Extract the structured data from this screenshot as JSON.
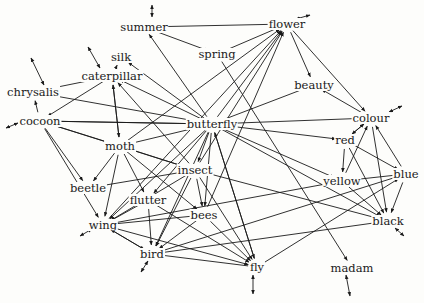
{
  "nodes": [
    {
      "id": "summer",
      "label": "summer",
      "x": 144,
      "y": 27
    },
    {
      "id": "flower",
      "label": "flower",
      "x": 287,
      "y": 24
    },
    {
      "id": "spring",
      "label": "spring",
      "x": 217,
      "y": 54
    },
    {
      "id": "silk",
      "label": "silk",
      "x": 121,
      "y": 57
    },
    {
      "id": "caterpillar",
      "label": "caterpillar",
      "x": 112,
      "y": 76
    },
    {
      "id": "beauty",
      "label": "beauty",
      "x": 314,
      "y": 85
    },
    {
      "id": "chrysalis",
      "label": "chrysalis",
      "x": 33,
      "y": 92
    },
    {
      "id": "cocoon",
      "label": "cocoon",
      "x": 40,
      "y": 121
    },
    {
      "id": "butterfly",
      "label": "butterfly",
      "x": 212,
      "y": 124
    },
    {
      "id": "colour",
      "label": "colour",
      "x": 371,
      "y": 118
    },
    {
      "id": "moth",
      "label": "moth",
      "x": 120,
      "y": 146
    },
    {
      "id": "red",
      "label": "red",
      "x": 345,
      "y": 140
    },
    {
      "id": "insect",
      "label": "insect",
      "x": 195,
      "y": 170
    },
    {
      "id": "yellow",
      "label": "yellow",
      "x": 342,
      "y": 181
    },
    {
      "id": "blue",
      "label": "blue",
      "x": 406,
      "y": 174
    },
    {
      "id": "beetle",
      "label": "beetle",
      "x": 88,
      "y": 188
    },
    {
      "id": "flutter",
      "label": "flutter",
      "x": 148,
      "y": 200
    },
    {
      "id": "bees",
      "label": "bees",
      "x": 204,
      "y": 215
    },
    {
      "id": "black",
      "label": "black",
      "x": 388,
      "y": 221
    },
    {
      "id": "wing",
      "label": "wing",
      "x": 103,
      "y": 225
    },
    {
      "id": "bird",
      "label": "bird",
      "x": 152,
      "y": 254
    },
    {
      "id": "fly",
      "label": "fly",
      "x": 257,
      "y": 267
    },
    {
      "id": "madam",
      "label": "madam",
      "x": 352,
      "y": 268
    }
  ],
  "edges": [
    [
      "flower",
      "summer"
    ],
    [
      "summer",
      "spring"
    ],
    [
      "butterfly",
      "summer"
    ],
    [
      "butterfly",
      "caterpillar"
    ],
    [
      "spring",
      "flower"
    ],
    [
      "flower",
      "beauty"
    ],
    [
      "flower",
      "colour"
    ],
    [
      "butterfly",
      "flower"
    ],
    [
      "moth",
      "flower"
    ],
    [
      "insect",
      "flower"
    ],
    [
      "bees",
      "flower"
    ],
    [
      "wing",
      "flower"
    ],
    [
      "caterpillar",
      "chrysalis"
    ],
    [
      "caterpillar",
      "silk"
    ],
    [
      "caterpillar",
      "cocoon"
    ],
    [
      "caterpillar",
      "moth"
    ],
    [
      "moth",
      "caterpillar"
    ],
    [
      "insect",
      "caterpillar"
    ],
    [
      "butterfly",
      "silk"
    ],
    [
      "cocoon",
      "chrysalis"
    ],
    [
      "butterfly",
      "chrysalis"
    ],
    [
      "butterfly",
      "cocoon"
    ],
    [
      "cocoon",
      "butterfly"
    ],
    [
      "butterfly",
      "beauty"
    ],
    [
      "butterfly",
      "colour"
    ],
    [
      "butterfly",
      "red"
    ],
    [
      "butterfly",
      "yellow"
    ],
    [
      "butterfly",
      "black"
    ],
    [
      "butterfly",
      "moth"
    ],
    [
      "butterfly",
      "insect"
    ],
    [
      "butterfly",
      "wing"
    ],
    [
      "butterfly",
      "bird"
    ],
    [
      "butterfly",
      "fly"
    ],
    [
      "butterfly",
      "bees"
    ],
    [
      "butterfly",
      "flutter"
    ],
    [
      "colour",
      "beauty"
    ],
    [
      "red",
      "colour"
    ],
    [
      "colour",
      "red"
    ],
    [
      "yellow",
      "colour"
    ],
    [
      "blue",
      "colour"
    ],
    [
      "colour",
      "black"
    ],
    [
      "red",
      "blue"
    ],
    [
      "red",
      "yellow"
    ],
    [
      "yellow",
      "blue"
    ],
    [
      "blue",
      "black"
    ],
    [
      "yellow",
      "black"
    ],
    [
      "red",
      "black"
    ],
    [
      "cocoon",
      "moth"
    ],
    [
      "cocoon",
      "insect"
    ],
    [
      "cocoon",
      "beetle"
    ],
    [
      "cocoon",
      "wing"
    ],
    [
      "moth",
      "beetle"
    ],
    [
      "moth",
      "flutter"
    ],
    [
      "moth",
      "wing"
    ],
    [
      "moth",
      "insect"
    ],
    [
      "moth",
      "bees"
    ],
    [
      "insect",
      "beetle"
    ],
    [
      "insect",
      "wing"
    ],
    [
      "insect",
      "bird"
    ],
    [
      "insect",
      "bees"
    ],
    [
      "insect",
      "black"
    ],
    [
      "insect",
      "fly"
    ],
    [
      "flutter",
      "wing"
    ],
    [
      "flutter",
      "bird"
    ],
    [
      "flutter",
      "fly"
    ],
    [
      "bees",
      "wing"
    ],
    [
      "bees",
      "bird"
    ],
    [
      "bees",
      "fly"
    ],
    [
      "wing",
      "bird"
    ],
    [
      "wing",
      "fly"
    ],
    [
      "bird",
      "wing"
    ],
    [
      "fly",
      "bird"
    ],
    [
      "fly",
      "blue"
    ],
    [
      "bird",
      "blue"
    ],
    [
      "bird",
      "black"
    ],
    [
      "wing",
      "yellow"
    ],
    [
      "spring",
      "madam"
    ],
    [
      "fly",
      "butterfly"
    ]
  ],
  "stubs": [
    {
      "x1": 152,
      "y1": 17,
      "x2": 152,
      "y2": 5
    },
    {
      "x1": 296,
      "y1": 19,
      "x2": 310,
      "y2": 15
    },
    {
      "x1": 100,
      "y1": 68,
      "x2": 88,
      "y2": 47
    },
    {
      "x1": 44,
      "y1": 85,
      "x2": 31,
      "y2": 58
    },
    {
      "x1": 18,
      "y1": 123,
      "x2": 6,
      "y2": 128
    },
    {
      "x1": 389,
      "y1": 112,
      "x2": 402,
      "y2": 106
    },
    {
      "x1": 92,
      "y1": 229,
      "x2": 80,
      "y2": 236
    },
    {
      "x1": 148,
      "y1": 261,
      "x2": 141,
      "y2": 272
    },
    {
      "x1": 395,
      "y1": 228,
      "x2": 404,
      "y2": 236
    },
    {
      "x1": 253,
      "y1": 275,
      "x2": 253,
      "y2": 294
    },
    {
      "x1": 346,
      "y1": 275,
      "x2": 350,
      "y2": 296
    }
  ]
}
